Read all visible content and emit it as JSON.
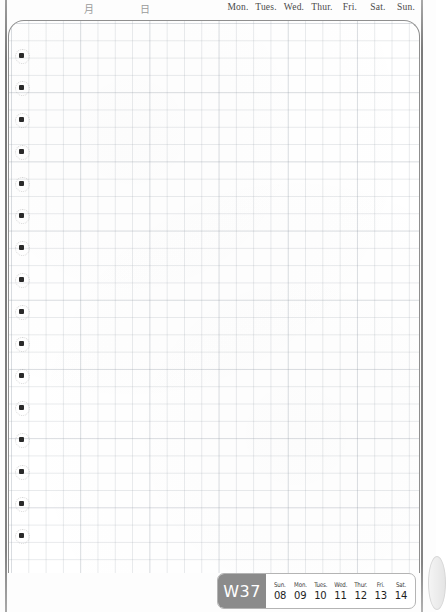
{
  "page": {
    "paper_color": "#ffffff",
    "rule_color": "#8c96a0",
    "edge_color": "#6a6a6a"
  },
  "header": {
    "cjk_month": "月",
    "cjk_day": "日",
    "weekdays": [
      "Mon.",
      "Tues.",
      "Wed.",
      "Thur.",
      "Fri.",
      "Sat.",
      "Sun."
    ]
  },
  "margin_bullets": {
    "count": 16,
    "first_y": 53,
    "spacing": 32,
    "color": "#2a2a2a"
  },
  "grid": {
    "cell_size_px": 17.3,
    "line_color": "#8c96a0",
    "corner_radius_px": 16
  },
  "week_badge": {
    "week_label": "W37",
    "label_bg": "#8b8b8b",
    "label_color": "#ffffff",
    "days": [
      {
        "name": "Sun.",
        "date": "08"
      },
      {
        "name": "Mon.",
        "date": "09"
      },
      {
        "name": "Tues.",
        "date": "10"
      },
      {
        "name": "Wed.",
        "date": "11"
      },
      {
        "name": "Thur.",
        "date": "12"
      },
      {
        "name": "Fri.",
        "date": "13"
      },
      {
        "name": "Sat.",
        "date": "14"
      }
    ]
  }
}
